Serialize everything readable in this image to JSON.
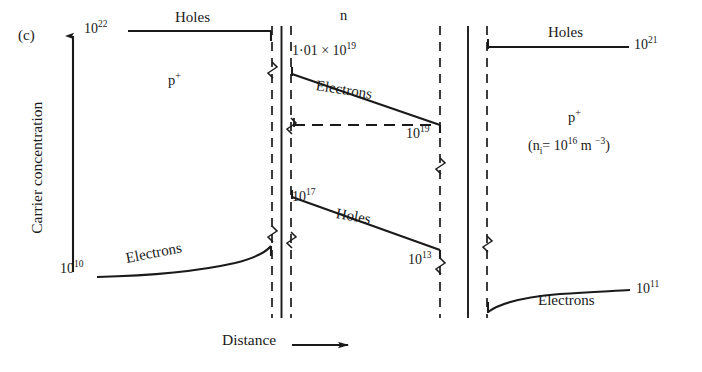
{
  "figure": {
    "panel_letter": "(c)",
    "y_axis_label": "Carrier concentration",
    "x_axis_label": "Distance",
    "note": "(n<sub>i</sub>= 10<sup>16</sup>  m <sup>−3</sup>)"
  },
  "regions": [
    {
      "id": "left-p-plus",
      "label": "p⁺"
    },
    {
      "id": "middle-n",
      "label": "n"
    },
    {
      "id": "right-p-plus",
      "label": "p⁺"
    }
  ],
  "labels": {
    "left_holes_value": "10",
    "left_holes_exp": "22",
    "left_holes_name": "Holes",
    "left_electrons_value": "10",
    "left_electrons_exp": "10",
    "left_electrons_name": "Electrons",
    "n_electrons_start": "1·01 × 10",
    "n_electrons_start_exp": "19",
    "n_electrons_name": "Electrons",
    "n_electrons_end_value": "10",
    "n_electrons_end_exp": "19",
    "n_holes_start_value": "10",
    "n_holes_start_exp": "17",
    "n_holes_name": "Holes",
    "n_holes_end_value": "10",
    "n_holes_end_exp": "13",
    "right_holes_name": "Holes",
    "right_holes_value": "10",
    "right_holes_exp": "21",
    "right_electrons_name": "Electrons",
    "right_electrons_value": "10",
    "right_electrons_exp": "11"
  },
  "chart_data": {
    "type": "line",
    "title": "",
    "xlabel": "Distance",
    "ylabel": "Carrier concentration",
    "scale": "log10",
    "grid": false,
    "legend": "inline-annotations",
    "annotations": [
      "(c)",
      "(n_i = 10^16 m^-3)"
    ],
    "regions": [
      {
        "name": "p+",
        "order": 1,
        "label": "p⁺"
      },
      {
        "name": "n",
        "order": 2,
        "label": "n"
      },
      {
        "name": "p+",
        "order": 3,
        "label": "p⁺"
      }
    ],
    "series": [
      {
        "name": "Holes (left p+)",
        "region": "p+ left",
        "shape": "flat",
        "values": [
          1e+22,
          1e+22
        ],
        "value_labels": [
          "10^22",
          ""
        ],
        "start_exponent": 22,
        "end_exponent": 22
      },
      {
        "name": "Electrons (left p+)",
        "region": "p+ left",
        "shape": "rising-curve",
        "values": [
          10000000000.0,
          1e+17
        ],
        "value_labels": [
          "10^10",
          ""
        ],
        "start_exponent": 10,
        "end_exponent": 17
      },
      {
        "name": "Electrons (n)",
        "region": "n",
        "shape": "linear-descending",
        "values": [
          1.01e+19,
          1e+19
        ],
        "value_labels": [
          "1·01 × 10^19",
          "10^19"
        ],
        "start_exponent": 19.004,
        "end_exponent": 19
      },
      {
        "name": "Holes (n)",
        "region": "n",
        "shape": "linear-descending",
        "values": [
          1e+17,
          10000000000000.0
        ],
        "value_labels": [
          "10^17",
          "10^13"
        ],
        "start_exponent": 17,
        "end_exponent": 13
      },
      {
        "name": "Holes (right p+)",
        "region": "p+ right",
        "shape": "flat",
        "values": [
          1e+21,
          1e+21
        ],
        "value_labels": [
          "",
          "10^21"
        ],
        "start_exponent": 21,
        "end_exponent": 21
      },
      {
        "name": "Electrons (right p+)",
        "region": "p+ right",
        "shape": "rising-curve-flattening",
        "values": [
          1000000000.0,
          100000000000.0
        ],
        "value_labels": [
          "",
          "10^11"
        ],
        "start_exponent": 9,
        "end_exponent": 11
      }
    ],
    "reference_lines": [
      {
        "name": "10^19 dashed level",
        "value": 1e+19,
        "style": "dashed",
        "region": "n"
      }
    ],
    "junctions": [
      {
        "name": "left junction p+/n",
        "style": "solid-with-dashed-depletion-edges"
      },
      {
        "name": "right junction n/p+",
        "style": "solid-with-dashed-depletion-edges"
      }
    ]
  }
}
